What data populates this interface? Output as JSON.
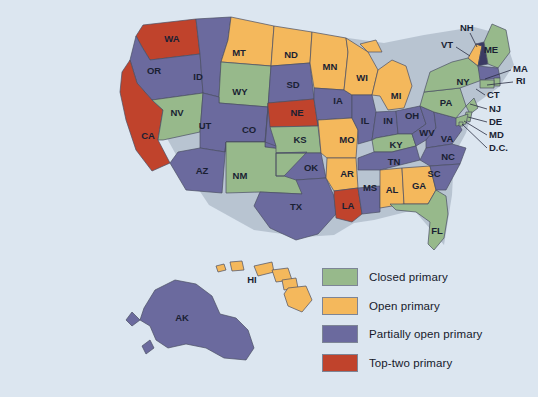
{
  "figure": {
    "name": "us-primary-election-types-map",
    "background_color": "#dce6f0"
  },
  "colors": {
    "closed": "#97b98b",
    "open": "#f4b85c",
    "partially_open": "#6b6a9e",
    "top_two": "#c0432c",
    "border": "#4a4f63",
    "label_text": "#1a1f33",
    "background": "#dce6f0"
  },
  "legend": {
    "items": [
      {
        "label": "Closed primary",
        "color": "#97b98b",
        "key": "closed"
      },
      {
        "label": "Open primary",
        "color": "#f4b85c",
        "key": "open"
      },
      {
        "label": "Partially open primary",
        "color": "#6b6a9e",
        "key": "partially_open"
      },
      {
        "label": "Top-two primary",
        "color": "#c0432c",
        "key": "top_two"
      }
    ]
  },
  "map_data": {
    "type": "choropleth",
    "title": "",
    "categories": [
      "Closed primary",
      "Open primary",
      "Partially open primary",
      "Top-two primary"
    ],
    "states": [
      {
        "code": "WA",
        "category": "Top-two primary",
        "color": "#c0432c",
        "label_x": 172,
        "label_y": 39
      },
      {
        "code": "OR",
        "category": "Partially open primary",
        "color": "#6b6a9e",
        "label_x": 154,
        "label_y": 71
      },
      {
        "code": "CA",
        "category": "Top-two primary",
        "color": "#c0432c",
        "label_x": 148,
        "label_y": 136
      },
      {
        "code": "ID",
        "category": "Partially open primary",
        "color": "#6b6a9e",
        "label_x": 198,
        "label_y": 77
      },
      {
        "code": "NV",
        "category": "Closed primary",
        "color": "#97b98b",
        "label_x": 177,
        "label_y": 113
      },
      {
        "code": "MT",
        "category": "Open primary",
        "color": "#f4b85c",
        "label_x": 239,
        "label_y": 53
      },
      {
        "code": "WY",
        "category": "Closed primary",
        "color": "#97b98b",
        "label_x": 240,
        "label_y": 92
      },
      {
        "code": "UT",
        "category": "Partially open primary",
        "color": "#6b6a9e",
        "label_x": 205,
        "label_y": 126
      },
      {
        "code": "AZ",
        "category": "Partially open primary",
        "color": "#6b6a9e",
        "label_x": 202,
        "label_y": 171
      },
      {
        "code": "CO",
        "category": "Partially open primary",
        "color": "#6b6a9e",
        "label_x": 249,
        "label_y": 130
      },
      {
        "code": "NM",
        "category": "Closed primary",
        "color": "#97b98b",
        "label_x": 240,
        "label_y": 176
      },
      {
        "code": "ND",
        "category": "Open primary",
        "color": "#f4b85c",
        "label_x": 291,
        "label_y": 55
      },
      {
        "code": "SD",
        "category": "Partially open primary",
        "color": "#6b6a9e",
        "label_x": 293,
        "label_y": 85
      },
      {
        "code": "NE",
        "category": "Top-two primary",
        "color": "#c0432c",
        "label_x": 297,
        "label_y": 113
      },
      {
        "code": "KS",
        "category": "Closed primary",
        "color": "#97b98b",
        "label_x": 300,
        "label_y": 140
      },
      {
        "code": "OK",
        "category": "Partially open primary",
        "color": "#6b6a9e",
        "label_x": 311,
        "label_y": 168
      },
      {
        "code": "TX",
        "category": "Partially open primary",
        "color": "#6b6a9e",
        "label_x": 296,
        "label_y": 207
      },
      {
        "code": "MN",
        "category": "Open primary",
        "color": "#f4b85c",
        "label_x": 330,
        "label_y": 67
      },
      {
        "code": "IA",
        "category": "Partially open primary",
        "color": "#6b6a9e",
        "label_x": 338,
        "label_y": 101
      },
      {
        "code": "MO",
        "category": "Open primary",
        "color": "#f4b85c",
        "label_x": 347,
        "label_y": 140
      },
      {
        "code": "AR",
        "category": "Open primary",
        "color": "#f4b85c",
        "label_x": 347,
        "label_y": 174
      },
      {
        "code": "LA",
        "category": "Top-two primary",
        "color": "#c0432c",
        "label_x": 348,
        "label_y": 206
      },
      {
        "code": "WI",
        "category": "Open primary",
        "color": "#f4b85c",
        "label_x": 362,
        "label_y": 78
      },
      {
        "code": "IL",
        "category": "Partially open primary",
        "color": "#6b6a9e",
        "label_x": 365,
        "label_y": 121
      },
      {
        "code": "MS",
        "category": "Partially open primary",
        "color": "#6b6a9e",
        "label_x": 370,
        "label_y": 188
      },
      {
        "code": "MI",
        "category": "Open primary",
        "color": "#f4b85c",
        "label_x": 396,
        "label_y": 96
      },
      {
        "code": "IN",
        "category": "Partially open primary",
        "color": "#6b6a9e",
        "label_x": 388,
        "label_y": 121
      },
      {
        "code": "KY",
        "category": "Closed primary",
        "color": "#97b98b",
        "label_x": 396,
        "label_y": 145
      },
      {
        "code": "TN",
        "category": "Partially open primary",
        "color": "#6b6a9e",
        "label_x": 394,
        "label_y": 162
      },
      {
        "code": "AL",
        "category": "Open primary",
        "color": "#f4b85c",
        "label_x": 392,
        "label_y": 190
      },
      {
        "code": "GA",
        "category": "Open primary",
        "color": "#f4b85c",
        "label_x": 419,
        "label_y": 186
      },
      {
        "code": "FL",
        "category": "Closed primary",
        "color": "#97b98b",
        "label_x": 437,
        "label_y": 231
      },
      {
        "code": "OH",
        "category": "Partially open primary",
        "color": "#6b6a9e",
        "label_x": 412,
        "label_y": 116
      },
      {
        "code": "WV",
        "category": "Partially open primary",
        "color": "#6b6a9e",
        "label_x": 427,
        "label_y": 133
      },
      {
        "code": "VA",
        "category": "Partially open primary",
        "color": "#6b6a9e",
        "label_x": 447,
        "label_y": 139
      },
      {
        "code": "NC",
        "category": "Partially open primary",
        "color": "#6b6a9e",
        "label_x": 448,
        "label_y": 157
      },
      {
        "code": "SC",
        "category": "Partially open primary",
        "color": "#6b6a9e",
        "label_x": 434,
        "label_y": 174
      },
      {
        "code": "PA",
        "category": "Closed primary",
        "color": "#97b98b",
        "label_x": 446,
        "label_y": 103
      },
      {
        "code": "NY",
        "category": "Closed primary",
        "color": "#97b98b",
        "label_x": 463,
        "label_y": 82
      },
      {
        "code": "ME",
        "category": "Closed primary",
        "color": "#97b98b",
        "label_x": 491,
        "label_y": 50
      },
      {
        "code": "HI",
        "category": "Open primary",
        "color": "#f4b85c",
        "label_x": 252,
        "label_y": 280
      },
      {
        "code": "AK",
        "category": "Partially open primary",
        "color": "#6b6a9e",
        "label_x": 182,
        "label_y": 318
      }
    ],
    "callout_states": [
      {
        "code": "NH",
        "category": "Partially open primary",
        "color": "#6b6a9e",
        "text_x": 460,
        "text_y": 28,
        "line": [
          [
            470,
            33
          ],
          [
            477,
            47
          ]
        ]
      },
      {
        "code": "VT",
        "category": "Open primary",
        "color": "#f4b85c",
        "text_x": 441,
        "text_y": 45,
        "line": [
          [
            456,
            47
          ],
          [
            470,
            56
          ]
        ]
      },
      {
        "code": "MA",
        "category": "Partially open primary",
        "color": "#6b6a9e",
        "text_x": 513,
        "text_y": 69,
        "line": [
          [
            511,
            70
          ],
          [
            485,
            79
          ]
        ]
      },
      {
        "code": "RI",
        "category": "Closed primary",
        "color": "#97b98b",
        "text_x": 516,
        "text_y": 81,
        "line": [
          [
            513,
            82
          ],
          [
            487,
            85
          ]
        ]
      },
      {
        "code": "CT",
        "category": "Closed primary",
        "color": "#97b98b",
        "text_x": 487,
        "text_y": 95,
        "line": [
          [
            485,
            95
          ],
          [
            476,
            89
          ]
        ]
      },
      {
        "code": "NJ",
        "category": "Closed primary",
        "color": "#97b98b",
        "text_x": 489,
        "text_y": 109,
        "line": [
          [
            487,
            109
          ],
          [
            470,
            104
          ]
        ]
      },
      {
        "code": "DE",
        "category": "Closed primary",
        "color": "#97b98b",
        "text_x": 489,
        "text_y": 122,
        "line": [
          [
            487,
            122
          ],
          [
            468,
            117
          ]
        ]
      },
      {
        "code": "MD",
        "category": "Closed primary",
        "color": "#97b98b",
        "text_x": 489,
        "text_y": 135,
        "line": [
          [
            487,
            135
          ],
          [
            464,
            121
          ]
        ]
      },
      {
        "code": "D.C.",
        "category": "Closed primary",
        "color": "#97b98b",
        "text_x": 489,
        "text_y": 148,
        "line": [
          [
            487,
            148
          ],
          [
            462,
            124
          ]
        ]
      }
    ]
  }
}
